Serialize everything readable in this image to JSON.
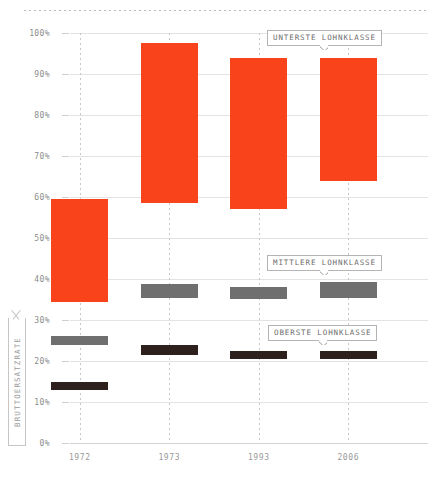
{
  "chart_data": {
    "type": "bar",
    "title": "",
    "subtitle": "",
    "xlabel": "",
    "ylabel": "BRUTTOERSATZRATE",
    "ylim": [
      0,
      100
    ],
    "yticks": [
      "0%",
      "10%",
      "20%",
      "30%",
      "40%",
      "50%",
      "60%",
      "70%",
      "80%",
      "90%",
      "100%"
    ],
    "ytick_values": [
      0,
      10,
      20,
      30,
      40,
      50,
      60,
      70,
      80,
      90,
      100
    ],
    "grid": "horizontal-solid + vertical-dotted",
    "legend_position": "inline-callouts",
    "categories": [
      "1972",
      "1973",
      "1993",
      "2006"
    ],
    "series": [
      {
        "name": "UNTERSTE LOHNKLASSE",
        "color": "#f9431b",
        "kind": "range",
        "high": [
          59.5,
          97.5,
          94.0,
          94.0
        ],
        "low": [
          34.5,
          58.5,
          57.0,
          64.0
        ]
      },
      {
        "name": "MITTLERE LOHNKLASSE",
        "color": "#6f6f6f",
        "kind": "range",
        "high": [
          26.0,
          38.8,
          38.0,
          39.3
        ],
        "low": [
          24.0,
          35.4,
          35.0,
          35.4
        ]
      },
      {
        "name": "OBERSTE LOHNKLASSE",
        "color": "#2e211d",
        "kind": "range",
        "high": [
          15.0,
          24.0,
          22.4,
          22.4
        ],
        "low": [
          13.0,
          21.5,
          20.5,
          20.5
        ]
      }
    ],
    "annotations": [
      {
        "text": "UNTERSTE LOHNKLASSE",
        "target": "2006 lowest-wage-class bar"
      },
      {
        "text": "MITTLERE LOHNKLASSE",
        "target": "2006 middle-wage-class bar"
      },
      {
        "text": "OBERSTE LOHNKLASSE",
        "target": "2006 highest-wage-class bar"
      }
    ]
  },
  "callouts": {
    "lowest": "UNTERSTE LOHNKLASSE",
    "middle": "MITTLERE LOHNKLASSE",
    "highest": "OBERSTE LOHNKLASSE"
  },
  "axis": {
    "y_title": "BRUTTOERSATZRATE"
  },
  "colors": {
    "lowest": "#f9431b",
    "middle": "#6f6f6f",
    "highest": "#2e211d",
    "grid": "#e3e3e3",
    "text": "#8a8a8a"
  }
}
